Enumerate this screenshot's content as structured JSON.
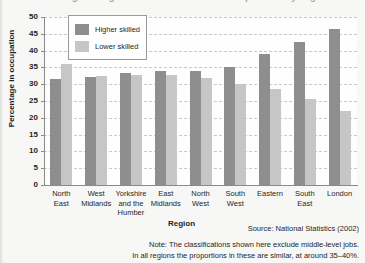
{
  "clipped_title": "Percentage in higher and lower skilled occupations by region",
  "axis": {
    "ylabel": "Percentage in occupation",
    "xlabel": "Region",
    "yticks": [
      0,
      5,
      10,
      15,
      20,
      25,
      30,
      35,
      40,
      45,
      50
    ]
  },
  "legend": {
    "items": [
      {
        "label": "Higher skilled",
        "color": "#8e8e8e"
      },
      {
        "label": "Lower skilled",
        "color": "#c6c6c6"
      }
    ]
  },
  "footnotes": {
    "source": "Source: National Statistics (2002)",
    "note_line1": "Note: The classifications shown here exclude middle-level jobs.",
    "note_line2": "In all regions the proportions in these are similar, at around 35–40%."
  },
  "chart_data": {
    "type": "bar",
    "title": "Percentage in higher and lower skilled occupations by region",
    "xlabel": "Region",
    "ylabel": "Percentage in occupation",
    "ylim": [
      0,
      50
    ],
    "ytick_step": 5,
    "grid": true,
    "legend_position": "top-left-inside",
    "categories": [
      "North East",
      "West Midlands",
      "Yorkshire and the Humber",
      "East Midlands",
      "North West",
      "South West",
      "Eastern",
      "South East",
      "London"
    ],
    "category_lines": [
      [
        "North",
        "East"
      ],
      [
        "West",
        "Midlands"
      ],
      [
        "Yorkshire",
        "and the",
        "Humber"
      ],
      [
        "East",
        "Midlands"
      ],
      [
        "North",
        "West"
      ],
      [
        "South",
        "West"
      ],
      [
        "Eastern"
      ],
      [
        "South",
        "East"
      ],
      [
        "London"
      ]
    ],
    "series": [
      {
        "name": "Higher skilled",
        "color": "#8e8e8e",
        "values": [
          31.5,
          32.0,
          33.2,
          34.0,
          34.0,
          35.0,
          39.0,
          42.5,
          46.5
        ]
      },
      {
        "name": "Lower skilled",
        "color": "#c6c6c6",
        "values": [
          36.0,
          32.5,
          32.8,
          32.8,
          31.8,
          30.0,
          28.5,
          25.5,
          22.0
        ]
      }
    ]
  }
}
